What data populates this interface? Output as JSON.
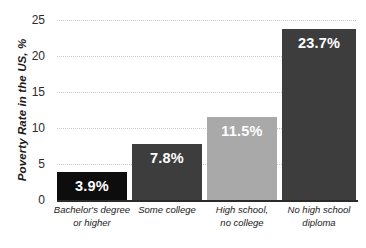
{
  "chart_data": {
    "type": "bar",
    "title": "",
    "subtitle": "",
    "xlabel": "",
    "ylabel": "Poverty Rate in the US, %",
    "ylim": [
      0,
      25
    ],
    "ytick_values": [
      0,
      5,
      10,
      15,
      20,
      25
    ],
    "ytick_labels": [
      "0",
      "5",
      "10",
      "15",
      "20",
      "25"
    ],
    "grid": "horizontal-dotted",
    "legend": "none",
    "categories": [
      "Bachelor's degree or higher",
      "Some college",
      "High school, no college",
      "No high school diploma"
    ],
    "category_lines": [
      [
        "Bachelor's degree",
        "or higher"
      ],
      [
        "Some college",
        ""
      ],
      [
        "High school,",
        "no college"
      ],
      [
        "No high school",
        "diploma"
      ]
    ],
    "values": [
      3.9,
      7.8,
      11.5,
      23.7
    ],
    "value_labels": [
      "3.9%",
      "7.8%",
      "11.5%",
      "23.7%"
    ],
    "bar_colors": [
      "#0d0d0d",
      "#3d3d3d",
      "#a9a9a9",
      "#3d3d3d"
    ],
    "value_label_color": "#ffffff",
    "axis_color": "#2b2b2b",
    "gridline_color": "#c9c9c9",
    "background": "#ffffff"
  }
}
